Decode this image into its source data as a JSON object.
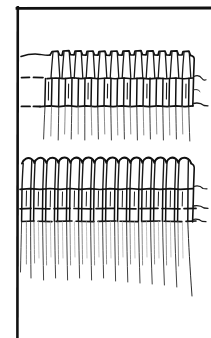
{
  "figure": {
    "title": "Hand-drawn line illustration",
    "caption": "",
    "background_color": "#ffffff",
    "ink_color": "#101010",
    "width": 211,
    "height": 338,
    "style": "pen-and-ink hatching / scientific drawing"
  },
  "frame": {
    "name": "L-shaped rule border",
    "top_rule": {
      "label": "top horizontal rule",
      "x1": 17,
      "y1": 8,
      "x2": 211,
      "y2": 8,
      "stroke_width": 2.6,
      "color": "#111111"
    },
    "left_rule": {
      "label": "left vertical rule",
      "x1": 17.5,
      "y1": 7,
      "x2": 17.5,
      "y2": 338,
      "stroke_width": 2.6,
      "color": "#111111"
    }
  },
  "groups": [
    {
      "id": "upper-band",
      "label": "upper row of columnar structures",
      "top_edge_y": 54,
      "band_1_y": 77,
      "band_2_y": 106,
      "fringe_bottom_y": 140,
      "column_count": 11,
      "x_start": 22,
      "x_end": 196,
      "description": "wavy capped upper margin with crenellated tops, vertical cell walls, two dashed cross-bands, tapering root fringe below"
    },
    {
      "id": "lower-band",
      "label": "lower row of columnar structures",
      "top_edge_y": 158,
      "band_1_y": 188,
      "band_2_y": 208,
      "band_3_y": 220,
      "fringe_bottom_y": 300,
      "column_count": 12,
      "x_start": 22,
      "x_end": 198,
      "description": "scalloped arched upper margin, vertical cell walls, three dashed cross-bands, long tapering root fringe below"
    }
  ],
  "annotations": {
    "dash_marks_left_upper": [
      "y=77",
      "y=106"
    ],
    "dash_marks_left_lower": [
      "y=188",
      "y=208",
      "y=220"
    ],
    "tendrils_right": "curved filaments extending past the right margin of both groups"
  }
}
